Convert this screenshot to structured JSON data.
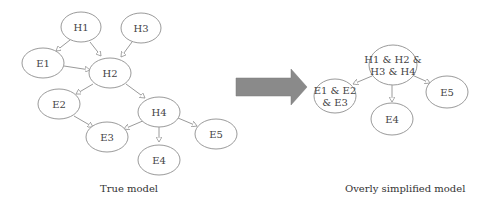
{
  "true_model": {
    "caption": "True model",
    "nodes": [
      {
        "id": "H1",
        "label": "H1"
      },
      {
        "id": "H3",
        "label": "H3"
      },
      {
        "id": "E1",
        "label": "E1"
      },
      {
        "id": "H2",
        "label": "H2"
      },
      {
        "id": "E2",
        "label": "E2"
      },
      {
        "id": "H4",
        "label": "H4"
      },
      {
        "id": "E3",
        "label": "E3"
      },
      {
        "id": "E4",
        "label": "E4"
      },
      {
        "id": "E5",
        "label": "E5"
      }
    ],
    "edges": [
      [
        "H1",
        "E1"
      ],
      [
        "H1",
        "H2"
      ],
      [
        "H3",
        "H2"
      ],
      [
        "E1",
        "H2"
      ],
      [
        "H2",
        "E2"
      ],
      [
        "H2",
        "H4"
      ],
      [
        "E2",
        "E3"
      ],
      [
        "H4",
        "E3"
      ],
      [
        "H4",
        "E4"
      ],
      [
        "H4",
        "E5"
      ]
    ]
  },
  "arrow": {
    "color": "#8a8a8a"
  },
  "simplified_model": {
    "caption": "Overly simplified model",
    "nodes": [
      {
        "id": "H",
        "label_line1": "H1 & H2 &",
        "label_line2": "H3 & H4"
      },
      {
        "id": "E123",
        "label_line1": "E1 & E2",
        "label_line2": "& E3"
      },
      {
        "id": "E4",
        "label": "E4"
      },
      {
        "id": "E5",
        "label": "E5"
      }
    ],
    "edges": [
      [
        "H",
        "E123"
      ],
      [
        "H",
        "E4"
      ],
      [
        "H",
        "E5"
      ]
    ]
  }
}
